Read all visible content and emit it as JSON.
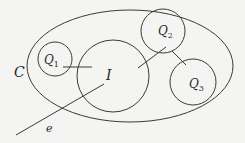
{
  "diagram": {
    "background": "#f4f4f2",
    "stroke_color": "#3a3a3a",
    "container": {
      "label": "C"
    },
    "nodes": [
      {
        "id": "Q1",
        "label": "Q",
        "subscript": "1"
      },
      {
        "id": "I",
        "label": "I",
        "subscript": ""
      },
      {
        "id": "Q2",
        "label": "Q",
        "subscript": "2"
      },
      {
        "id": "Q3",
        "label": "Q",
        "subscript": "3"
      }
    ],
    "edges": [
      {
        "from": "Q1",
        "to": "I"
      },
      {
        "from": "I",
        "to": "Q2"
      },
      {
        "from": "Q2",
        "to": "Q3"
      }
    ],
    "external_edge": {
      "label": "e",
      "to": "I"
    }
  }
}
